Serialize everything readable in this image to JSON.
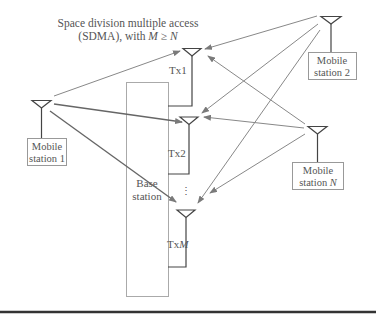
{
  "title": {
    "line1": "Space division multiple access",
    "line2_prefix": "(SDMA), with ",
    "line2_m": "M",
    "line2_ge": " ≥ ",
    "line2_n": "N"
  },
  "base_station": {
    "label_line1": "Base",
    "label_line2": "station",
    "antennas": [
      {
        "label": "Tx1"
      },
      {
        "label": "Tx2"
      },
      {
        "label_prefix": "Tx",
        "label_italic": "M"
      }
    ],
    "ellipsis": "⋮"
  },
  "mobile_stations": [
    {
      "line1": "Mobile",
      "line2": "station 1"
    },
    {
      "line1": "Mobile",
      "line2": "station 2"
    },
    {
      "line1": "Mobile",
      "line2_prefix": "station ",
      "line2_italic": "N"
    }
  ],
  "colors": {
    "arrow": "#888888",
    "stroke": "#444444",
    "box": "#999999",
    "text": "#555555"
  }
}
